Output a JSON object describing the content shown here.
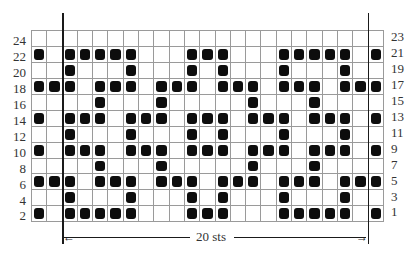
{
  "chart_data": {
    "type": "heatmap",
    "title": "",
    "columns": 23,
    "rows": [
      {
        "left_label": "24",
        "right_label": "23",
        "filled": []
      },
      {
        "left_label": "22",
        "right_label": "21",
        "filled": [
          0,
          2,
          3,
          4,
          5,
          6,
          10,
          11,
          12,
          16,
          17,
          18,
          19,
          20,
          22
        ]
      },
      {
        "left_label": "20",
        "right_label": "19",
        "filled": [
          2,
          6,
          10,
          12,
          16,
          20
        ]
      },
      {
        "left_label": "18",
        "right_label": "17",
        "filled": [
          0,
          1,
          2,
          4,
          5,
          6,
          8,
          9,
          10,
          12,
          13,
          14,
          16,
          17,
          18,
          20,
          21,
          22
        ]
      },
      {
        "left_label": "16",
        "right_label": "15",
        "filled": [
          4,
          8,
          14,
          18
        ]
      },
      {
        "left_label": "14",
        "right_label": "13",
        "filled": [
          0,
          2,
          3,
          4,
          6,
          7,
          8,
          10,
          11,
          12,
          14,
          15,
          16,
          18,
          19,
          20,
          22
        ]
      },
      {
        "left_label": "12",
        "right_label": "11",
        "filled": [
          2,
          6,
          10,
          12,
          16,
          20
        ]
      },
      {
        "left_label": "10",
        "right_label": "9",
        "filled": [
          0,
          2,
          3,
          4,
          6,
          7,
          8,
          10,
          11,
          12,
          14,
          15,
          16,
          18,
          19,
          20,
          22
        ]
      },
      {
        "left_label": "8",
        "right_label": "7",
        "filled": [
          4,
          8,
          14,
          18
        ]
      },
      {
        "left_label": "6",
        "right_label": "5",
        "filled": [
          0,
          1,
          2,
          4,
          5,
          6,
          8,
          9,
          10,
          12,
          13,
          14,
          16,
          17,
          18,
          20,
          21,
          22
        ]
      },
      {
        "left_label": "4",
        "right_label": "3",
        "filled": [
          2,
          6,
          10,
          12,
          16,
          20
        ]
      },
      {
        "left_label": "2",
        "right_label": "1",
        "filled": [
          0,
          2,
          3,
          4,
          5,
          6,
          10,
          11,
          12,
          16,
          17,
          18,
          19,
          20,
          22
        ]
      }
    ],
    "repeat": {
      "start_column": 2,
      "end_column": 21,
      "label": "20 sts"
    },
    "colors": {
      "filled": "#0d0d0d",
      "empty": "#ffffff",
      "gridline": "#9a9a9a"
    }
  },
  "repeat_label": "20 sts"
}
